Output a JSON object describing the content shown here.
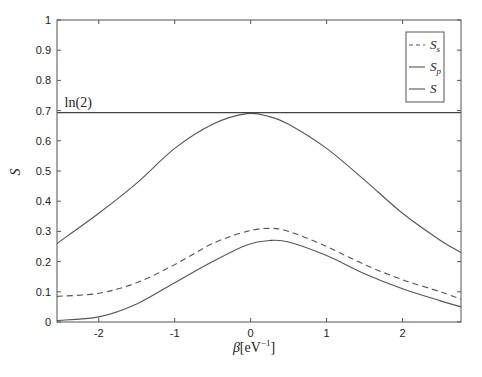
{
  "chart_data": {
    "type": "line",
    "title": "",
    "xlabel": "β[eV⁻¹]",
    "xlabel_parts": {
      "symbol": "β",
      "unit_open": "[eV",
      "exp": "−1",
      "unit_close": "]"
    },
    "ylabel": "S",
    "xlim": [
      -2.55,
      2.77
    ],
    "ylim": [
      0,
      1
    ],
    "xticks": [
      -2,
      -1,
      0,
      1,
      2
    ],
    "xtick_labels": [
      "-2",
      "-1",
      "0",
      "1",
      "2"
    ],
    "yticks": [
      0,
      0.1,
      0.2,
      0.3,
      0.4,
      0.5,
      0.6,
      0.7,
      0.8,
      0.9,
      1
    ],
    "ytick_labels": [
      "0",
      "0.1",
      "0.2",
      "0.3",
      "0.4",
      "0.5",
      "0.6",
      "0.7",
      "0.8",
      "0.9",
      "1"
    ],
    "grid": false,
    "legend_position": "upper right",
    "annotations": [
      {
        "text": "ln(2)",
        "x": -2.45,
        "y": 0.72
      }
    ],
    "reference_line": {
      "label": "ln(2)",
      "y": 0.693
    },
    "x": [
      -2.55,
      -2.0,
      -1.5,
      -1.0,
      -0.5,
      -0.05,
      0.25,
      0.5,
      1.0,
      1.5,
      2.0,
      2.5,
      2.77
    ],
    "series": [
      {
        "name": "S_s",
        "style": "dashed",
        "values": [
          0.085,
          0.095,
          0.13,
          0.19,
          0.26,
          0.3,
          0.31,
          0.3,
          0.25,
          0.19,
          0.14,
          0.1,
          0.075
        ]
      },
      {
        "name": "S_p",
        "style": "solid",
        "values": [
          0.005,
          0.017,
          0.06,
          0.13,
          0.2,
          0.255,
          0.27,
          0.265,
          0.22,
          0.16,
          0.11,
          0.07,
          0.05
        ]
      },
      {
        "name": "S",
        "style": "solid",
        "values": [
          0.26,
          0.36,
          0.46,
          0.575,
          0.655,
          0.69,
          0.68,
          0.655,
          0.575,
          0.47,
          0.36,
          0.27,
          0.23
        ]
      }
    ]
  },
  "legend": {
    "items": [
      {
        "symbol": "S",
        "sub": "s",
        "style": "dashed"
      },
      {
        "symbol": "S",
        "sub": "p",
        "style": "solid"
      },
      {
        "symbol": "S",
        "sub": "",
        "style": "solid"
      }
    ]
  },
  "annotation_ln2": "ln(2)"
}
